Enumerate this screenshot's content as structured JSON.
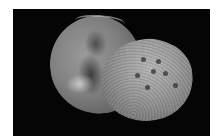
{
  "image": {
    "subject": "microfossil shell",
    "description": "Grayscale photograph of a rounded shell with two lobes on a black background",
    "background_color": "#050505",
    "border_color": "#ffffff"
  }
}
